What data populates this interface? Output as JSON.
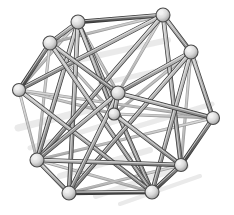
{
  "figure": {
    "background_color": "#ffffff",
    "width": 234,
    "height": 215
  },
  "style": {
    "strut_fill": "#a9a9a9",
    "strut_fill_light": "#c2c2c2",
    "strut_fill_dark": "#6e6e6e",
    "strut_outline": "#3a3a3a",
    "strut_outline_faint": "#9a9a9a",
    "node_fill": "#d8d8d8",
    "node_highlight": "#f2f2f2",
    "node_outline": "#4a4a4a",
    "shadow_color": "#e4e4e4",
    "node_radius": 6.5,
    "strut_width": 3.2,
    "strut_width_thin": 1.6
  },
  "graph_data": {
    "type": "wireframe-graph",
    "node_count": 14,
    "edge_count": 43,
    "nodes": [
      {
        "id": 0,
        "name": "node-top-left",
        "x": 78,
        "y": 22,
        "depth": "front",
        "r": 7
      },
      {
        "id": 1,
        "name": "node-top-right",
        "x": 163,
        "y": 15,
        "depth": "back",
        "r": 7
      },
      {
        "id": 2,
        "name": "node-upper-left",
        "x": 50,
        "y": 43,
        "depth": "front",
        "r": 7
      },
      {
        "id": 3,
        "name": "node-upper-right",
        "x": 191,
        "y": 52,
        "depth": "back",
        "r": 7
      },
      {
        "id": 4,
        "name": "node-left",
        "x": 19,
        "y": 90,
        "depth": "front",
        "r": 6.5
      },
      {
        "id": 5,
        "name": "node-right",
        "x": 213,
        "y": 118,
        "depth": "back",
        "r": 6.5
      },
      {
        "id": 6,
        "name": "node-lower-left",
        "x": 37,
        "y": 160,
        "depth": "front",
        "r": 7
      },
      {
        "id": 7,
        "name": "node-lower-right",
        "x": 181,
        "y": 165,
        "depth": "back",
        "r": 6.5
      },
      {
        "id": 8,
        "name": "node-bottom-left",
        "x": 69,
        "y": 193,
        "depth": "front",
        "r": 7
      },
      {
        "id": 9,
        "name": "node-bottom-right",
        "x": 152,
        "y": 192,
        "depth": "front",
        "r": 7
      },
      {
        "id": 10,
        "name": "node-inner-upper",
        "x": 118,
        "y": 93,
        "depth": "front",
        "r": 7
      },
      {
        "id": 11,
        "name": "node-inner-lower",
        "x": 114,
        "y": 114,
        "depth": "front",
        "r": 6
      },
      {
        "id": 12,
        "name": "node-mid-upper-left",
        "x": 45,
        "y": 108,
        "depth": "back",
        "r": 0
      },
      {
        "id": 13,
        "name": "node-mid-right",
        "x": 196,
        "y": 110,
        "depth": "back",
        "r": 0
      }
    ],
    "edges": [
      {
        "from": 0,
        "to": 1,
        "weight": "thick",
        "shade": "dark"
      },
      {
        "from": 0,
        "to": 2,
        "weight": "thick",
        "shade": "mid"
      },
      {
        "from": 0,
        "to": 4,
        "weight": "thin",
        "shade": "light"
      },
      {
        "from": 0,
        "to": 6,
        "weight": "thick",
        "shade": "mid"
      },
      {
        "from": 0,
        "to": 8,
        "weight": "thick",
        "shade": "mid"
      },
      {
        "from": 0,
        "to": 9,
        "weight": "thick",
        "shade": "mid"
      },
      {
        "from": 0,
        "to": 10,
        "weight": "thin",
        "shade": "light"
      },
      {
        "from": 0,
        "to": 11,
        "weight": "thick",
        "shade": "mid"
      },
      {
        "from": 1,
        "to": 3,
        "weight": "thick",
        "shade": "mid"
      },
      {
        "from": 1,
        "to": 2,
        "weight": "thin",
        "shade": "light"
      },
      {
        "from": 1,
        "to": 4,
        "weight": "thick",
        "shade": "mid"
      },
      {
        "from": 1,
        "to": 6,
        "weight": "thick",
        "shade": "mid"
      },
      {
        "from": 1,
        "to": 10,
        "weight": "thin",
        "shade": "light"
      },
      {
        "from": 1,
        "to": 7,
        "weight": "thick",
        "shade": "mid"
      },
      {
        "from": 2,
        "to": 4,
        "weight": "thick",
        "shade": "dark"
      },
      {
        "from": 2,
        "to": 6,
        "weight": "thin",
        "shade": "light"
      },
      {
        "from": 2,
        "to": 10,
        "weight": "thick",
        "shade": "mid"
      },
      {
        "from": 2,
        "to": 11,
        "weight": "thin",
        "shade": "light"
      },
      {
        "from": 2,
        "to": 9,
        "weight": "thick",
        "shade": "mid"
      },
      {
        "from": 3,
        "to": 5,
        "weight": "thick",
        "shade": "mid"
      },
      {
        "from": 3,
        "to": 10,
        "weight": "thick",
        "shade": "mid"
      },
      {
        "from": 3,
        "to": 11,
        "weight": "thin",
        "shade": "light"
      },
      {
        "from": 3,
        "to": 7,
        "weight": "thin",
        "shade": "light"
      },
      {
        "from": 3,
        "to": 9,
        "weight": "thick",
        "shade": "mid"
      },
      {
        "from": 3,
        "to": 8,
        "weight": "thick",
        "shade": "mid"
      },
      {
        "from": 4,
        "to": 6,
        "weight": "thin",
        "shade": "light"
      },
      {
        "from": 4,
        "to": 11,
        "weight": "thin",
        "shade": "light"
      },
      {
        "from": 4,
        "to": 5,
        "weight": "thin",
        "shade": "light"
      },
      {
        "from": 4,
        "to": 9,
        "weight": "thick",
        "shade": "mid"
      },
      {
        "from": 5,
        "to": 7,
        "weight": "thick",
        "shade": "dark"
      },
      {
        "from": 5,
        "to": 10,
        "weight": "thick",
        "shade": "mid"
      },
      {
        "from": 5,
        "to": 11,
        "weight": "thin",
        "shade": "light"
      },
      {
        "from": 5,
        "to": 6,
        "weight": "thin",
        "shade": "light"
      },
      {
        "from": 6,
        "to": 8,
        "weight": "thick",
        "shade": "mid"
      },
      {
        "from": 6,
        "to": 9,
        "weight": "thin",
        "shade": "light"
      },
      {
        "from": 6,
        "to": 10,
        "weight": "thick",
        "shade": "mid"
      },
      {
        "from": 6,
        "to": 7,
        "weight": "thick",
        "shade": "mid"
      },
      {
        "from": 7,
        "to": 9,
        "weight": "thick",
        "shade": "dark"
      },
      {
        "from": 7,
        "to": 11,
        "weight": "thick",
        "shade": "mid"
      },
      {
        "from": 7,
        "to": 8,
        "weight": "thin",
        "shade": "light"
      },
      {
        "from": 8,
        "to": 9,
        "weight": "thick",
        "shade": "dark"
      },
      {
        "from": 8,
        "to": 10,
        "weight": "thick",
        "shade": "mid"
      },
      {
        "from": 10,
        "to": 11,
        "weight": "thick",
        "shade": "mid"
      }
    ],
    "shadow_streaks": [
      {
        "x1": 18,
        "y1": 128,
        "x2": 96,
        "y2": 108,
        "w": 7
      },
      {
        "x1": 30,
        "y1": 148,
        "x2": 120,
        "y2": 120,
        "w": 5
      },
      {
        "x1": 60,
        "y1": 176,
        "x2": 150,
        "y2": 150,
        "w": 6
      },
      {
        "x1": 96,
        "y1": 196,
        "x2": 186,
        "y2": 166,
        "w": 6
      },
      {
        "x1": 120,
        "y1": 204,
        "x2": 200,
        "y2": 176,
        "w": 4
      },
      {
        "x1": 78,
        "y1": 60,
        "x2": 168,
        "y2": 40,
        "w": 6
      },
      {
        "x1": 100,
        "y1": 84,
        "x2": 196,
        "y2": 62,
        "w": 5
      },
      {
        "x1": 132,
        "y1": 128,
        "x2": 212,
        "y2": 104,
        "w": 5
      }
    ]
  }
}
